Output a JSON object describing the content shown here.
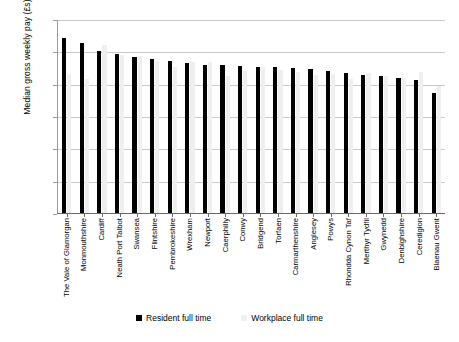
{
  "chart_data": {
    "type": "bar",
    "title": "",
    "xlabel": "",
    "ylabel": "Median gross weekly pay (£s)",
    "ylim": [
      0,
      600
    ],
    "yticks": [
      0,
      100,
      200,
      300,
      400,
      500,
      600
    ],
    "grid": true,
    "legend_position": "bottom",
    "categories": [
      "The Vale of Glamorgan",
      "Monmouthshire",
      "Cardiff",
      "Neath Port Talbot",
      "Swansea",
      "Flintshire",
      "Pembrokeshire",
      "Wrexham",
      "Newport",
      "Caerphilly",
      "Conwy",
      "Bridgend",
      "Torfaen",
      "Carmarthenshire",
      "Anglesey",
      "Powys",
      "Rhondda Cynon Taf",
      "Merthyr Tydfil",
      "Gwynedd",
      "Denbighshire",
      "Ceredigion",
      "Blaenau Gwent"
    ],
    "series": [
      {
        "name": "Resident full time",
        "color": "#000000",
        "values": [
          541,
          525,
          501,
          493,
          484,
          477,
          470,
          464,
          459,
          457,
          456,
          453,
          452,
          450,
          446,
          438,
          432,
          427,
          423,
          419,
          411,
          372
        ]
      },
      {
        "name": "Workplace full time",
        "color": "#efefef",
        "values": [
          430,
          413,
          520,
          489,
          487,
          470,
          452,
          466,
          468,
          424,
          438,
          451,
          443,
          436,
          428,
          430,
          415,
          432,
          425,
          418,
          436,
          392
        ]
      }
    ]
  },
  "legend": {
    "items": [
      {
        "label": "Resident full time",
        "swatch": "black-square-icon"
      },
      {
        "label": "Workplace full time",
        "swatch": "gray-square-icon"
      }
    ]
  }
}
